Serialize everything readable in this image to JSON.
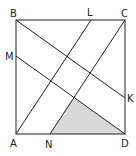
{
  "diagram": {
    "type": "geometry-square",
    "points": {
      "A": {
        "label": "A",
        "x": 16,
        "y": 134
      },
      "B": {
        "label": "B",
        "x": 16,
        "y": 20
      },
      "C": {
        "label": "C",
        "x": 125,
        "y": 20
      },
      "D": {
        "label": "D",
        "x": 125,
        "y": 134
      },
      "L": {
        "label": "L",
        "x": 91,
        "y": 20
      },
      "M": {
        "label": "M",
        "x": 16,
        "y": 56
      },
      "N": {
        "label": "N",
        "x": 50,
        "y": 134
      },
      "K": {
        "label": "K",
        "x": 125,
        "y": 98
      }
    },
    "segments": [
      [
        "A",
        "B"
      ],
      [
        "B",
        "C"
      ],
      [
        "C",
        "D"
      ],
      [
        "D",
        "A"
      ],
      [
        "B",
        "K"
      ],
      [
        "M",
        "D"
      ],
      [
        "A",
        "L"
      ],
      [
        "N",
        "C"
      ]
    ],
    "shaded_region": {
      "vertices": [
        "N",
        "D",
        "intersection(NC, MD)"
      ],
      "color": "#d9d9d9"
    },
    "colors": {
      "stroke": "#222222",
      "shade": "#d9d9d9"
    }
  }
}
